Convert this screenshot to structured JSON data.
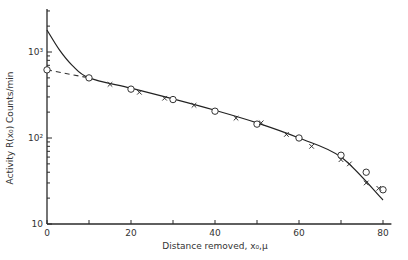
{
  "chart_data": {
    "type": "scatter",
    "title": "",
    "xlabel": "Distance removed, x₀,μ",
    "ylabel": "Activity R(x₀) Counts/min",
    "xlim": [
      0,
      82
    ],
    "ylim": [
      10,
      3000
    ],
    "yscale": "log",
    "x_ticks": [
      0,
      20,
      40,
      60,
      80
    ],
    "x_tick_labels": [
      "0",
      "20",
      "40",
      "60",
      "80"
    ],
    "y_ticks": [
      10,
      100,
      1000
    ],
    "y_tick_labels": [
      "10",
      "10²",
      "10³"
    ],
    "grid": false,
    "series": [
      {
        "name": "circles",
        "marker": "circle",
        "points": [
          [
            0,
            620
          ],
          [
            10,
            500
          ],
          [
            20,
            370
          ],
          [
            30,
            280
          ],
          [
            40,
            205
          ],
          [
            50,
            145
          ],
          [
            60,
            100
          ],
          [
            70,
            63
          ],
          [
            76,
            40
          ],
          [
            80,
            25
          ]
        ]
      },
      {
        "name": "crosses",
        "marker": "x",
        "points": [
          [
            15,
            420
          ],
          [
            22,
            340
          ],
          [
            28,
            290
          ],
          [
            35,
            240
          ],
          [
            45,
            170
          ],
          [
            51,
            150
          ],
          [
            57,
            110
          ],
          [
            63,
            80
          ],
          [
            70,
            56
          ],
          [
            72,
            50
          ],
          [
            76,
            30
          ],
          [
            79,
            26
          ]
        ]
      },
      {
        "name": "fitted curve",
        "marker": "line",
        "points": [
          [
            0,
            1800
          ],
          [
            3,
            1050
          ],
          [
            6,
            700
          ],
          [
            10,
            500
          ],
          [
            20,
            380
          ],
          [
            30,
            285
          ],
          [
            40,
            210
          ],
          [
            50,
            150
          ],
          [
            60,
            100
          ],
          [
            70,
            60
          ],
          [
            80,
            19
          ]
        ]
      },
      {
        "name": "extrapolation",
        "marker": "dashed",
        "points": [
          [
            0,
            620
          ],
          [
            10,
            500
          ]
        ]
      }
    ]
  }
}
